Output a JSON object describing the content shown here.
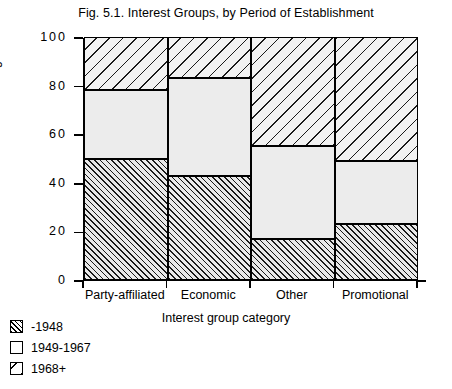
{
  "chart_data": {
    "type": "bar",
    "subtype": "stacked-percentage",
    "title": "Fig. 5.1. Interest Groups, by Period of Establishment",
    "xlabel": "Interest group category",
    "ylabel": "Percentage",
    "categories": [
      "Party-affiliated",
      "Economic",
      "Other",
      "Promotional"
    ],
    "series": [
      {
        "name": "-1948",
        "values": [
          50,
          43,
          17,
          23
        ],
        "fill": "dense-forward-hatch"
      },
      {
        "name": "1949-1967",
        "values": [
          28,
          40,
          38,
          26
        ],
        "fill": "empty"
      },
      {
        "name": "1968+",
        "values": [
          22,
          17,
          45,
          51
        ],
        "fill": "sparse-backward-hatch"
      }
    ],
    "cumulative_tops": [
      [
        50,
        78,
        100
      ],
      [
        43,
        83,
        100
      ],
      [
        17,
        55,
        100
      ],
      [
        23,
        49,
        100
      ]
    ],
    "ylim": [
      0,
      100
    ],
    "yticks": [
      "0",
      "20",
      "40",
      "60",
      "80",
      "100"
    ],
    "grid": false,
    "legend_position": "below-left"
  },
  "legend": {
    "items": [
      {
        "label": "-1948",
        "swatch": "dense-forward-hatch-swatch"
      },
      {
        "label": "1949-1967",
        "swatch": "empty-swatch"
      },
      {
        "label": "1968+",
        "swatch": "sparse-backward-hatch-swatch"
      }
    ]
  },
  "colors": {
    "ink": "#000000",
    "background": "#ffffff",
    "segment_fill": "#ececec"
  }
}
